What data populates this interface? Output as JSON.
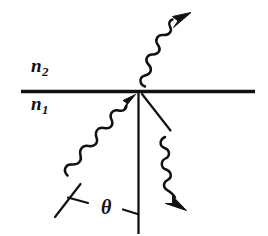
{
  "figure": {
    "type": "optics-refraction-diagram",
    "background_color": "#ffffff",
    "ink_color": "#111111",
    "labels": {
      "upper_medium": {
        "symbol": "n",
        "subscript": "2",
        "text": "n2"
      },
      "lower_medium": {
        "symbol": "n",
        "subscript": "1",
        "text": "n1"
      },
      "angle": {
        "text": "θ",
        "name": "theta"
      }
    },
    "elements": {
      "interface_line": "horizontal-boundary",
      "normal_line": "vertical-normal",
      "incident_wave": "wavy-arrow-up-right",
      "transmitted_wave": "wavy-arrow-up-right",
      "reflected_wave": "wavy-arrow-down-right",
      "reflection_ray_guide": "straight-diagonal-segment",
      "angle_tick_left": "perpendicular-tick",
      "angle_tick_right": "short-tick"
    }
  }
}
